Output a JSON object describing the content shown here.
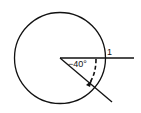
{
  "diagram": {
    "type": "unit-circle-angle",
    "radius_label": "1",
    "angle_label": "−40°",
    "angle_degrees": -40,
    "stroke_color": "#111111",
    "background": "#ffffff"
  }
}
